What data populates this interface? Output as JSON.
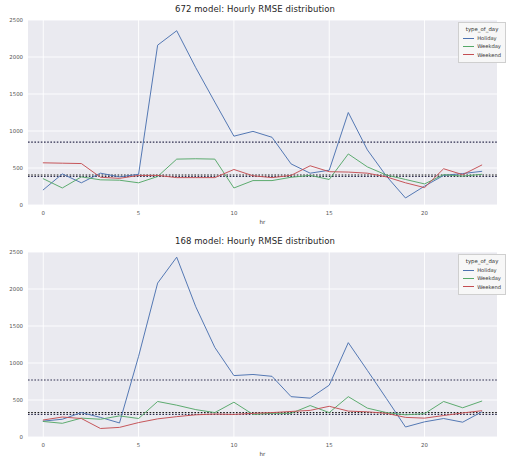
{
  "figure": {
    "width": 510,
    "height": 464,
    "background": "#ffffff",
    "plot_background": "#eaeaf0",
    "grid_color": "#ffffff",
    "tick_color": "#555555"
  },
  "legend": {
    "title": "type_of_day",
    "entries": [
      {
        "label": "Holiday",
        "color": "#4c72b0"
      },
      {
        "label": "Weekday",
        "color": "#55a868"
      },
      {
        "label": "Weekend",
        "color": "#c44e52"
      }
    ]
  },
  "axes": {
    "xlabel": "hr",
    "ylabel": "",
    "xticks": [
      0,
      5,
      10,
      15,
      20
    ],
    "yticks": [
      0,
      500,
      1000,
      1500,
      2000,
      2500
    ],
    "xlim": [
      -0.8,
      23.8
    ],
    "ylim": [
      0,
      2500
    ]
  },
  "chart_data": [
    {
      "type": "line",
      "title": "672 model: Hourly RMSE distribution",
      "xlabel": "hr",
      "ylabel": "",
      "xlim": [
        -0.8,
        23.8
      ],
      "ylim": [
        0,
        2500
      ],
      "xticks": [
        0,
        5,
        10,
        15,
        20
      ],
      "yticks": [
        0,
        500,
        1000,
        1500,
        2000,
        2500
      ],
      "grid": true,
      "legend_title": "type_of_day",
      "legend_position": "upper right",
      "x": [
        0,
        1,
        2,
        3,
        4,
        5,
        6,
        7,
        8,
        9,
        10,
        11,
        12,
        13,
        14,
        15,
        16,
        17,
        18,
        19,
        20,
        21,
        22,
        23
      ],
      "series": [
        {
          "name": "Holiday",
          "color": "#4c72b0",
          "values": [
            205,
            420,
            300,
            430,
            380,
            415,
            2160,
            2355,
            1855,
            1390,
            930,
            995,
            915,
            555,
            430,
            470,
            1250,
            745,
            390,
            95,
            255,
            400,
            425,
            455
          ]
        },
        {
          "name": "Weekday",
          "color": "#55a868",
          "values": [
            355,
            230,
            380,
            340,
            335,
            300,
            385,
            620,
            625,
            620,
            230,
            330,
            330,
            375,
            400,
            345,
            690,
            515,
            405,
            345,
            285,
            410,
            390,
            415
          ]
        },
        {
          "name": "Weekend",
          "color": "#c44e52",
          "values": [
            570,
            565,
            560,
            375,
            360,
            400,
            400,
            370,
            370,
            370,
            480,
            395,
            370,
            400,
            530,
            450,
            445,
            430,
            380,
            300,
            235,
            490,
            410,
            540
          ]
        }
      ],
      "reference_lines": [
        {
          "value": 850,
          "style": "dotted",
          "color": "#2f2f4f"
        },
        {
          "value": 405,
          "style": "dotted",
          "color": "#1a1a1a"
        },
        {
          "value": 385,
          "style": "dotted",
          "color": "#2f2f4f"
        }
      ]
    },
    {
      "type": "line",
      "title": "168 model: Hourly RMSE distribution",
      "xlabel": "hr",
      "ylabel": "",
      "xlim": [
        -0.8,
        23.8
      ],
      "ylim": [
        0,
        2500
      ],
      "xticks": [
        0,
        5,
        10,
        15,
        20
      ],
      "yticks": [
        0,
        500,
        1000,
        1500,
        2000,
        2500
      ],
      "grid": true,
      "legend_title": "type_of_day",
      "legend_position": "upper right",
      "x": [
        0,
        1,
        2,
        3,
        4,
        5,
        6,
        7,
        8,
        9,
        10,
        11,
        12,
        13,
        14,
        15,
        16,
        17,
        18,
        19,
        20,
        21,
        22,
        23
      ],
      "series": [
        {
          "name": "Holiday",
          "color": "#4c72b0",
          "values": [
            215,
            240,
            330,
            265,
            190,
            1090,
            2080,
            2430,
            1760,
            1210,
            830,
            845,
            820,
            545,
            525,
            700,
            1275,
            900,
            520,
            135,
            205,
            250,
            200,
            340
          ]
        },
        {
          "name": "Weekday",
          "color": "#55a868",
          "values": [
            210,
            185,
            255,
            240,
            285,
            250,
            480,
            430,
            370,
            330,
            470,
            305,
            320,
            320,
            425,
            330,
            545,
            390,
            330,
            300,
            315,
            480,
            395,
            485
          ]
        },
        {
          "name": "Weekend",
          "color": "#c44e52",
          "values": [
            230,
            270,
            250,
            115,
            130,
            195,
            245,
            275,
            300,
            310,
            305,
            320,
            330,
            345,
            360,
            415,
            350,
            340,
            320,
            265,
            255,
            290,
            325,
            355
          ]
        }
      ],
      "reference_lines": [
        {
          "value": 770,
          "style": "dotted",
          "color": "#2f2f4f"
        },
        {
          "value": 330,
          "style": "dotted",
          "color": "#1a1a1a"
        },
        {
          "value": 305,
          "style": "dotted",
          "color": "#2f2f4f"
        }
      ]
    }
  ]
}
